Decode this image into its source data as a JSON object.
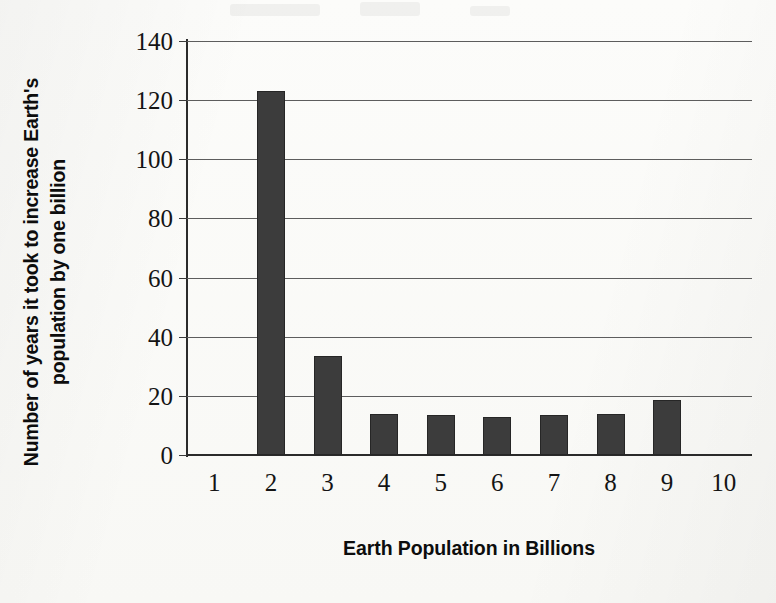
{
  "chart_data": {
    "type": "bar",
    "title": "",
    "xlabel": "Earth Population in Billions",
    "ylabel": "Number of years it took to increase Earth's population by one billion",
    "ylabel_lines": [
      "Number of years it took to increase Earth's",
      "population by one billion"
    ],
    "categories": [
      "1",
      "2",
      "3",
      "4",
      "5",
      "6",
      "7",
      "8",
      "9",
      "10"
    ],
    "values": [
      0,
      123,
      33.5,
      14,
      13.5,
      13,
      13.5,
      14,
      18.5,
      0
    ],
    "ylim": [
      0,
      140
    ],
    "ytick_values": [
      0,
      20,
      40,
      60,
      80,
      100,
      120,
      140
    ],
    "ytick_labels": [
      "0",
      "20",
      "40",
      "60",
      "80",
      "100",
      "120",
      "140"
    ],
    "grid": true,
    "legend": "none",
    "bar_color": "#3c3c3c",
    "axis_color": "#2b2b2b",
    "gridline_color": "#5d5d5d"
  }
}
